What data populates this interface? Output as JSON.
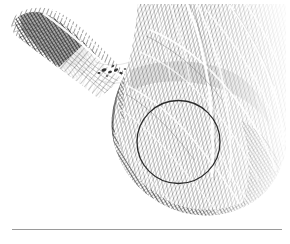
{
  "figure": {
    "kind": "engraving-illustration",
    "title": "",
    "caption": "",
    "background_color": "#ffffff",
    "ink_color": "#3a3a3a",
    "deep_shadow_color": "#1c1c1c",
    "midtone_color": "#6d6d6d",
    "highlight_color": "#ffffff",
    "annotation_color": "#2b2b2b",
    "rule_color": "#9a9a9a",
    "canvas": {
      "width": 290,
      "height": 244
    },
    "regions": [
      {
        "name": "left-tapering-band",
        "label": "",
        "description": "narrow hatched band entering from upper-left and tapering down to the right",
        "tone": "dark"
      },
      {
        "name": "central-white-notch",
        "label": "",
        "description": "pale V-shaped gap separating the left band from the main mass",
        "tone": "light"
      },
      {
        "name": "main-mass",
        "label": "",
        "description": "large rounded hatched mass occupying the right two thirds",
        "tone": "mid"
      },
      {
        "name": "highlight-streaks",
        "label": "",
        "description": "sweeping pale curved striations across the main mass",
        "tone": "light"
      },
      {
        "name": "speckle-cluster",
        "label": "",
        "description": "small dark specks within the pale notch",
        "tone": "dark"
      }
    ],
    "annotation_circle": {
      "name": "region-of-interest",
      "label": "",
      "center_x": 178.5,
      "center_y": 142,
      "radius": 41.5,
      "stroke_width": 1.3,
      "color": "#2b2b2b"
    },
    "caption_rule": {
      "name": "caption-separator",
      "x": 12,
      "y": 229,
      "width": 270,
      "color": "#9a9a9a"
    }
  }
}
